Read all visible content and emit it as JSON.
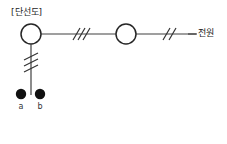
{
  "diagram": {
    "title": "[단선도]",
    "type": "single-line-diagram",
    "source_label": "전원",
    "terminals": [
      {
        "id": "a",
        "label": "a"
      },
      {
        "id": "b",
        "label": "b"
      }
    ],
    "nodes": [
      {
        "id": "left-circle",
        "shape": "circle",
        "cx": 31,
        "cy": 34,
        "r": 10
      },
      {
        "id": "right-circle",
        "shape": "circle",
        "cx": 126,
        "cy": 34,
        "r": 10
      }
    ],
    "slash_marks": [
      {
        "id": "trunk-three-phase",
        "count": 3,
        "orientation": "horizontal",
        "x": 79,
        "y": 34
      },
      {
        "id": "source-two-phase",
        "count": 2,
        "orientation": "horizontal",
        "x": 168,
        "y": 34
      },
      {
        "id": "feeder-three-phase",
        "count": 3,
        "orientation": "vertical",
        "x": 31,
        "y": 62
      }
    ],
    "colors": {
      "stroke": "#404040",
      "dot_fill": "#111111",
      "background": "#ffffff",
      "text": "#1a1a1a"
    }
  }
}
